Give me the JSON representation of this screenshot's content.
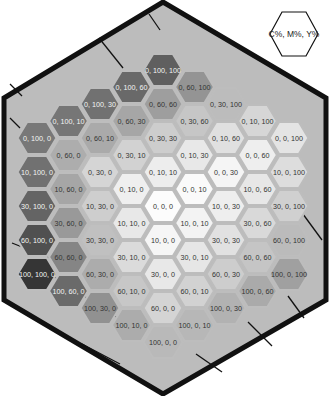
{
  "legend": {
    "label": "C%, M%, Y%"
  },
  "chart_data": {
    "type": "hexagonal color chart",
    "title": "",
    "legend_text": "C%, M%, Y%",
    "cells": [
      {
        "label": "0, 100, 100",
        "c": 0,
        "m": 100,
        "y": 100,
        "q": 0,
        "r": -6
      },
      {
        "label": "0, 100, 60",
        "c": 0,
        "m": 100,
        "y": 60,
        "q": -1,
        "r": -5
      },
      {
        "label": "0, 60, 100",
        "c": 0,
        "m": 60,
        "y": 100,
        "q": 1,
        "r": -6
      },
      {
        "label": "0, 100, 30",
        "c": 0,
        "m": 100,
        "y": 30,
        "q": -2,
        "r": -4
      },
      {
        "label": "0, 60, 60",
        "c": 0,
        "m": 60,
        "y": 60,
        "q": 0,
        "r": -5
      },
      {
        "label": "0, 30, 100",
        "c": 0,
        "m": 30,
        "y": 100,
        "q": 2,
        "r": -6
      },
      {
        "label": "0, 100, 10",
        "c": 0,
        "m": 100,
        "y": 10,
        "q": -3,
        "r": -3
      },
      {
        "label": "0, 60, 30",
        "c": 0,
        "m": 60,
        "y": 30,
        "q": -1,
        "r": -4
      },
      {
        "label": "0, 30, 60",
        "c": 0,
        "m": 30,
        "y": 60,
        "q": 1,
        "r": -5
      },
      {
        "label": "0, 10, 100",
        "c": 0,
        "m": 10,
        "y": 100,
        "q": 3,
        "r": -6
      },
      {
        "label": "0, 100, 0",
        "c": 0,
        "m": 100,
        "y": 0,
        "q": -4,
        "r": -2
      },
      {
        "label": "0, 60, 10",
        "c": 0,
        "m": 60,
        "y": 10,
        "q": -2,
        "r": -3
      },
      {
        "label": "0, 30, 30",
        "c": 0,
        "m": 30,
        "y": 30,
        "q": 0,
        "r": -4
      },
      {
        "label": "0, 10, 60",
        "c": 0,
        "m": 10,
        "y": 60,
        "q": 2,
        "r": -5
      },
      {
        "label": "0, 0, 100",
        "c": 0,
        "m": 0,
        "y": 100,
        "q": 4,
        "r": -6
      },
      {
        "label": "0, 60, 0",
        "c": 0,
        "m": 60,
        "y": 0,
        "q": -3,
        "r": -2
      },
      {
        "label": "0, 30, 10",
        "c": 0,
        "m": 30,
        "y": 10,
        "q": -1,
        "r": -3
      },
      {
        "label": "0, 10, 30",
        "c": 0,
        "m": 10,
        "y": 30,
        "q": 1,
        "r": -4
      },
      {
        "label": "0, 0, 60",
        "c": 0,
        "m": 0,
        "y": 60,
        "q": 3,
        "r": -5
      },
      {
        "label": "10, 100, 0",
        "c": 10,
        "m": 100,
        "y": 0,
        "q": -4,
        "r": -1
      },
      {
        "label": "0, 30, 0",
        "c": 0,
        "m": 30,
        "y": 0,
        "q": -2,
        "r": -2
      },
      {
        "label": "0, 10, 10",
        "c": 0,
        "m": 10,
        "y": 10,
        "q": 0,
        "r": -3
      },
      {
        "label": "0, 0, 30",
        "c": 0,
        "m": 0,
        "y": 30,
        "q": 2,
        "r": -4
      },
      {
        "label": "10, 0, 100",
        "c": 10,
        "m": 0,
        "y": 100,
        "q": 4,
        "r": -5
      },
      {
        "label": "10, 60, 0",
        "c": 10,
        "m": 60,
        "y": 0,
        "q": -3,
        "r": -1
      },
      {
        "label": "0, 10, 0",
        "c": 0,
        "m": 10,
        "y": 0,
        "q": -1,
        "r": -2
      },
      {
        "label": "0, 0, 10",
        "c": 0,
        "m": 0,
        "y": 10,
        "q": 1,
        "r": -3
      },
      {
        "label": "10, 0, 60",
        "c": 10,
        "m": 0,
        "y": 60,
        "q": 3,
        "r": -4
      },
      {
        "label": "30, 100, 0",
        "c": 30,
        "m": 100,
        "y": 0,
        "q": -4,
        "r": 0
      },
      {
        "label": "10, 30, 0",
        "c": 10,
        "m": 30,
        "y": 0,
        "q": -2,
        "r": -1
      },
      {
        "label": "0, 0, 0",
        "c": 0,
        "m": 0,
        "y": 0,
        "q": 0,
        "r": -2
      },
      {
        "label": "10, 0, 30",
        "c": 10,
        "m": 0,
        "y": 30,
        "q": 2,
        "r": -3
      },
      {
        "label": "30, 0, 100",
        "c": 30,
        "m": 0,
        "y": 100,
        "q": 4,
        "r": -4
      },
      {
        "label": "30, 60, 0",
        "c": 30,
        "m": 60,
        "y": 0,
        "q": -3,
        "r": 0
      },
      {
        "label": "10, 10, 0",
        "c": 10,
        "m": 10,
        "y": 0,
        "q": -1,
        "r": -1
      },
      {
        "label": "10, 0, 10",
        "c": 10,
        "m": 0,
        "y": 10,
        "q": 1,
        "r": -2
      },
      {
        "label": "30, 0, 60",
        "c": 30,
        "m": 0,
        "y": 60,
        "q": 3,
        "r": -3
      },
      {
        "label": "60, 100, 0",
        "c": 60,
        "m": 100,
        "y": 0,
        "q": -4,
        "r": 1
      },
      {
        "label": "30, 30, 0",
        "c": 30,
        "m": 30,
        "y": 0,
        "q": -2,
        "r": 0
      },
      {
        "label": "10, 0, 0",
        "c": 10,
        "m": 0,
        "y": 0,
        "q": 0,
        "r": -1
      },
      {
        "label": "30, 0, 30",
        "c": 30,
        "m": 0,
        "y": 30,
        "q": 2,
        "r": -2
      },
      {
        "label": "60, 0, 100",
        "c": 60,
        "m": 0,
        "y": 100,
        "q": 4,
        "r": -3
      },
      {
        "label": "60, 60, 0",
        "c": 60,
        "m": 60,
        "y": 0,
        "q": -3,
        "r": 1
      },
      {
        "label": "30, 10, 0",
        "c": 30,
        "m": 10,
        "y": 0,
        "q": -1,
        "r": 0
      },
      {
        "label": "30, 0, 10",
        "c": 30,
        "m": 0,
        "y": 10,
        "q": 1,
        "r": -1
      },
      {
        "label": "60, 0, 60",
        "c": 60,
        "m": 0,
        "y": 60,
        "q": 3,
        "r": -2
      },
      {
        "label": "100, 100, 0",
        "c": 100,
        "m": 100,
        "y": 0,
        "q": -4,
        "r": 2
      },
      {
        "label": "60, 30, 0",
        "c": 60,
        "m": 30,
        "y": 0,
        "q": -2,
        "r": 1
      },
      {
        "label": "30, 0, 0",
        "c": 30,
        "m": 0,
        "y": 0,
        "q": 0,
        "r": 0
      },
      {
        "label": "60, 0, 30",
        "c": 60,
        "m": 0,
        "y": 30,
        "q": 2,
        "r": -1
      },
      {
        "label": "100, 0, 100",
        "c": 100,
        "m": 0,
        "y": 100,
        "q": 4,
        "r": -2
      },
      {
        "label": "100, 60, 0",
        "c": 100,
        "m": 60,
        "y": 0,
        "q": -3,
        "r": 2
      },
      {
        "label": "60, 10, 0",
        "c": 60,
        "m": 10,
        "y": 0,
        "q": -1,
        "r": 1
      },
      {
        "label": "60, 0, 10",
        "c": 60,
        "m": 0,
        "y": 10,
        "q": 1,
        "r": 0
      },
      {
        "label": "100, 0, 60",
        "c": 100,
        "m": 0,
        "y": 60,
        "q": 3,
        "r": -1
      },
      {
        "label": "100, 30, 0",
        "c": 100,
        "m": 30,
        "y": 0,
        "q": -2,
        "r": 2
      },
      {
        "label": "60, 0, 0",
        "c": 60,
        "m": 0,
        "y": 0,
        "q": 0,
        "r": 1
      },
      {
        "label": "100, 0, 30",
        "c": 100,
        "m": 0,
        "y": 30,
        "q": 2,
        "r": 0
      },
      {
        "label": "100, 10, 0",
        "c": 100,
        "m": 10,
        "y": 0,
        "q": -1,
        "r": 2
      },
      {
        "label": "100, 0, 10",
        "c": 100,
        "m": 0,
        "y": 10,
        "q": 1,
        "r": 1
      },
      {
        "label": "100, 0, 0",
        "c": 100,
        "m": 0,
        "y": 0,
        "q": 0,
        "r": 2
      }
    ]
  },
  "colors": {
    "outline": "#111111",
    "background_panel": "#b9b9b9",
    "hex_border": "#bdbdbd",
    "legend_stroke": "#111111"
  }
}
